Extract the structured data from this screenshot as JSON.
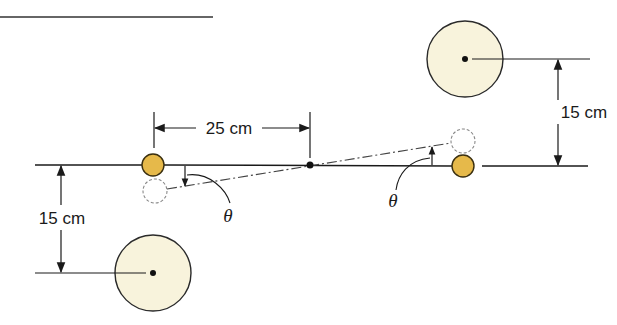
{
  "diagram": {
    "labels": {
      "rod_half_length": "25 cm",
      "separation_right": "15 cm",
      "separation_left": "15 cm",
      "angle_left": "θ",
      "angle_right": "θ"
    },
    "colors": {
      "small_sphere_fill": "#E6B94A",
      "small_sphere_stroke": "#3a2f10",
      "large_sphere_fill": "#F8F3DC",
      "large_sphere_stroke": "#2a2a2a",
      "line": "#1a1a1a",
      "dashed_sphere_stroke": "#888888"
    },
    "elements": {
      "small_sphere_left": {
        "cx": 153,
        "cy": 165,
        "r": 11
      },
      "small_sphere_right": {
        "cx": 463,
        "cy": 166,
        "r": 11
      },
      "displaced_sphere_left": {
        "cx": 155,
        "cy": 191,
        "r": 12
      },
      "displaced_sphere_right": {
        "cx": 463,
        "cy": 141,
        "r": 12
      },
      "large_sphere_top_right": {
        "cx": 465,
        "cy": 59,
        "r": 38
      },
      "large_sphere_bottom_left": {
        "cx": 153,
        "cy": 273,
        "r": 38
      },
      "pivot": {
        "cx": 310,
        "cy": 165
      }
    }
  }
}
